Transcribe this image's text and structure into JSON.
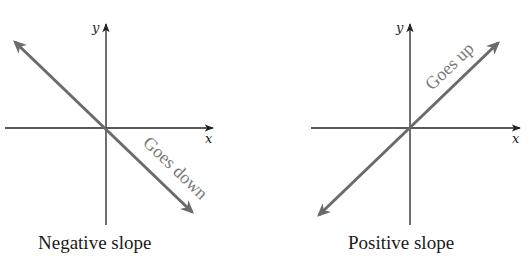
{
  "colors": {
    "axis": "#222222",
    "line": "#6b6b6b",
    "annotation": "#7a7a7a",
    "caption": "#1a1a1a",
    "background": "#ffffff"
  },
  "panels": [
    {
      "id": "negative",
      "x_axis_label": "x",
      "y_axis_label": "y",
      "annotation": "Goes down",
      "caption": "Negative slope",
      "slope_sign": "negative"
    },
    {
      "id": "positive",
      "x_axis_label": "x",
      "y_axis_label": "y",
      "annotation": "Goes up",
      "caption": "Positive slope",
      "slope_sign": "positive"
    }
  ]
}
